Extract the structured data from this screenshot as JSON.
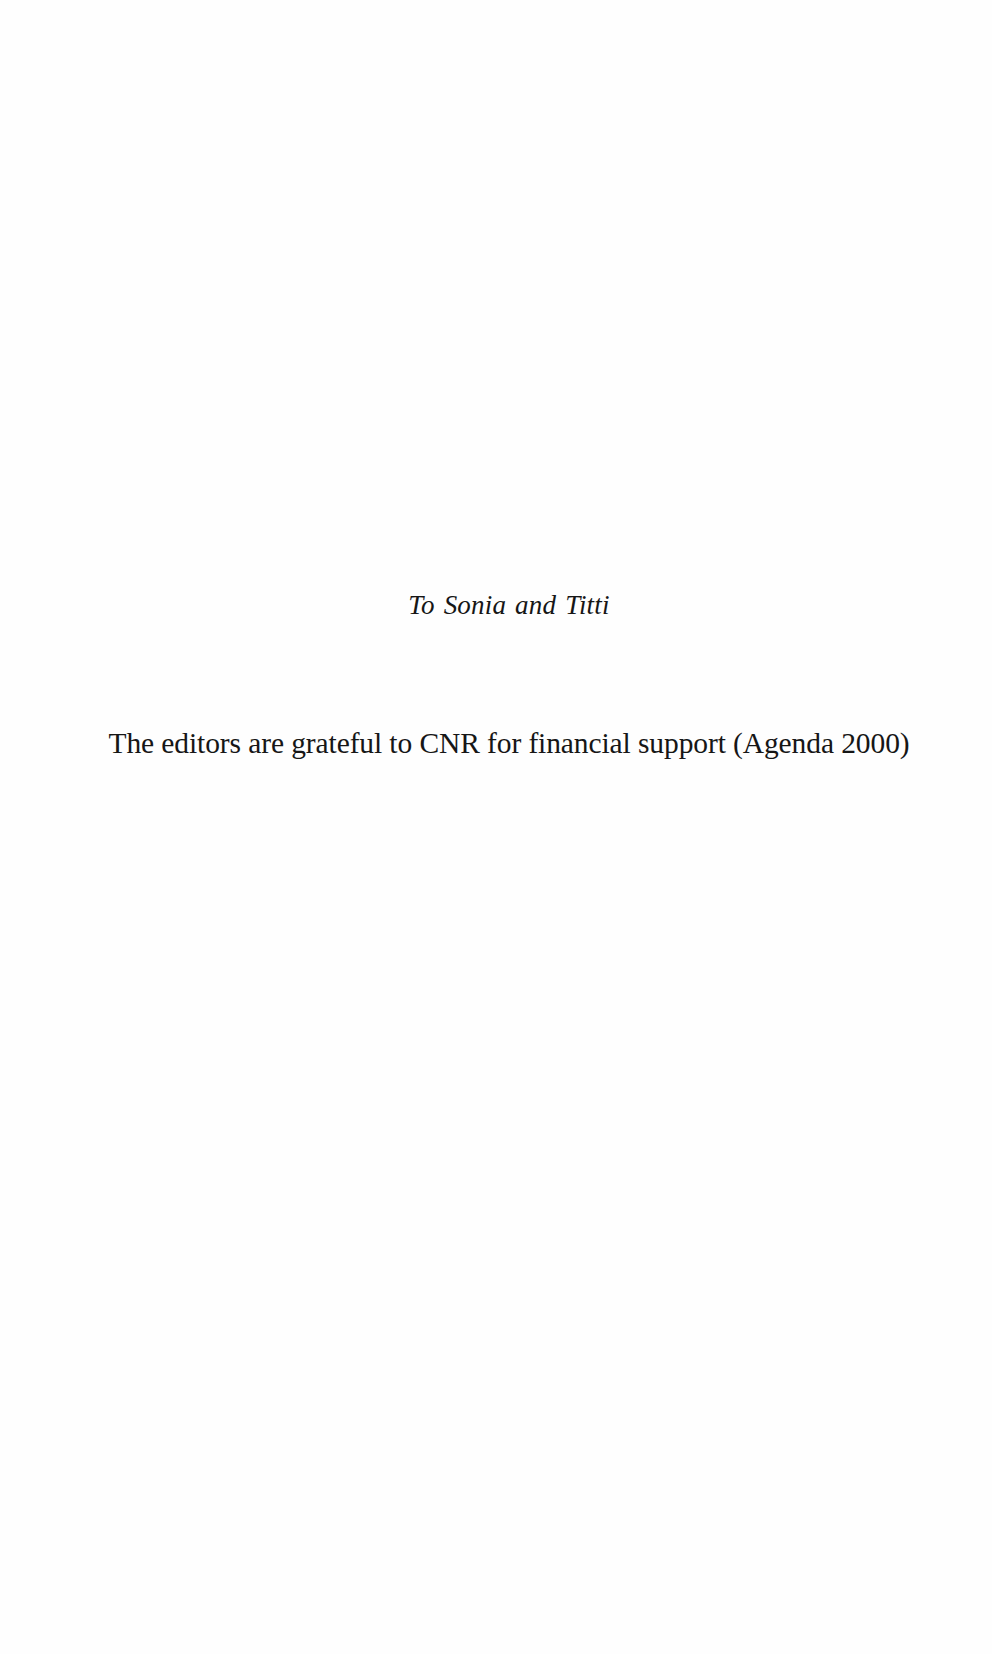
{
  "page": {
    "dedication": "To Sonia and Titti",
    "acknowledgement": "The editors are grateful to CNR for financial support (Agenda 2000)"
  }
}
